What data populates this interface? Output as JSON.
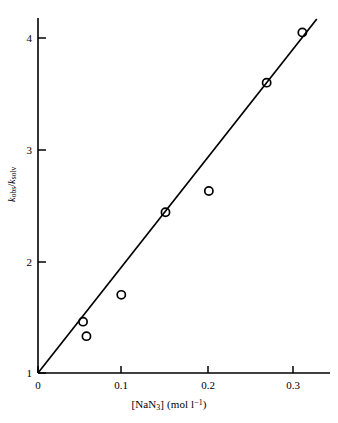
{
  "chart_data": {
    "type": "scatter",
    "title": "",
    "xlabel": "[NaN3] (mol l-1)",
    "xlabel_parts": {
      "bracket_open": "[NaN",
      "bracket_sub": "3",
      "bracket_close": "]",
      "units_open": " (mol l",
      "units_sup": "−1",
      "units_close": ")"
    },
    "ylabel": "kobs/ksolv",
    "ylabel_parts": {
      "k1": "k",
      "sub1": "obs",
      "slash": "/",
      "k2": "k",
      "sub2": "solv"
    },
    "xlim": [
      0,
      0.335
    ],
    "ylim": [
      1,
      4.25
    ],
    "xticks": [
      0,
      0.1,
      0.2,
      0.3
    ],
    "xtick_labels": [
      "0",
      "0.1",
      "0.2",
      "0.3"
    ],
    "yticks": [
      1,
      2,
      3,
      4
    ],
    "ytick_labels": [
      "1",
      "2",
      "3",
      "4"
    ],
    "grid": false,
    "legend": false,
    "marker": "open-circle",
    "marker_color": "#000000",
    "line_color": "#000000",
    "points": [
      {
        "x": 0.053,
        "y": 1.46
      },
      {
        "x": 0.057,
        "y": 1.33
      },
      {
        "x": 0.098,
        "y": 1.7
      },
      {
        "x": 0.15,
        "y": 2.44
      },
      {
        "x": 0.201,
        "y": 2.63
      },
      {
        "x": 0.269,
        "y": 3.6
      },
      {
        "x": 0.311,
        "y": 4.05
      }
    ],
    "fit_line": {
      "x_start": 0.0,
      "y_start": 1.0,
      "x_end": 0.328,
      "y_end": 4.17,
      "slope": 9.66,
      "intercept": 1.0
    }
  }
}
